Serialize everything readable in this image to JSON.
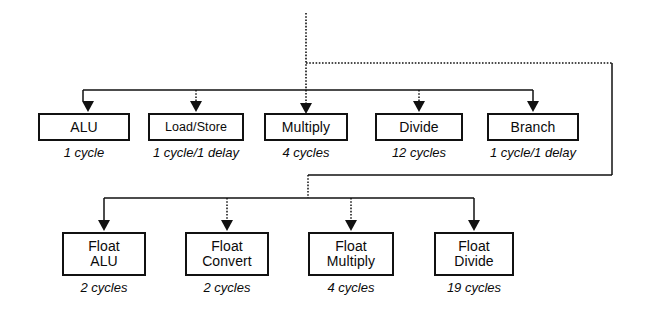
{
  "diagram": {
    "colors": {
      "ink": "#111111",
      "background": "#ffffff"
    },
    "trunk": {
      "name": "instruction-dispatch-trunk",
      "style": "dotted"
    },
    "rows": [
      {
        "name": "integer-unit-row",
        "units": [
          {
            "label": "ALU",
            "caption": "1 cycle",
            "x": 38,
            "y": 113,
            "w": 92,
            "h": 28,
            "arrow_x": 88
          },
          {
            "label": "Load/Store",
            "caption": "1 cycle/1 delay",
            "x": 148,
            "y": 113,
            "w": 96,
            "h": 28,
            "arrow_x": 196
          },
          {
            "label": "Multiply",
            "caption": "4 cycles",
            "x": 264,
            "y": 113,
            "w": 84,
            "h": 28,
            "arrow_x": 306
          },
          {
            "label": "Divide",
            "caption": "12 cycles",
            "x": 375,
            "y": 113,
            "w": 88,
            "h": 28,
            "arrow_x": 419
          },
          {
            "label": "Branch",
            "caption": "1 cycle/1 delay",
            "x": 487,
            "y": 113,
            "w": 92,
            "h": 28,
            "arrow_x": 533
          }
        ]
      },
      {
        "name": "floating-point-unit-row",
        "units": [
          {
            "label": "Float\nALU",
            "caption": "2 cycles",
            "x": 62,
            "y": 232,
            "w": 84,
            "h": 44,
            "arrow_x": 104
          },
          {
            "label": "Float\nConvert",
            "caption": "2 cycles",
            "x": 185,
            "y": 232,
            "w": 84,
            "h": 44,
            "arrow_x": 227
          },
          {
            "label": "Float\nMultiply",
            "caption": "4 cycles",
            "x": 308,
            "y": 232,
            "w": 86,
            "h": 44,
            "arrow_x": 351
          },
          {
            "label": "Float\nDivide",
            "caption": "19 cycles",
            "x": 434,
            "y": 232,
            "w": 80,
            "h": 44,
            "arrow_x": 474
          }
        ]
      }
    ],
    "bus_geometry": {
      "trunk_x": 306,
      "trunk_top_y": 13,
      "fp_tap_y": 63,
      "integer_bus_y": 90,
      "integer_bus_x1": 83,
      "integer_bus_x2": 533,
      "right_riser_x": 612,
      "fp_feed_y": 175,
      "fp_bus_y": 198,
      "fp_bus_x1": 104,
      "fp_bus_x2": 474
    }
  }
}
